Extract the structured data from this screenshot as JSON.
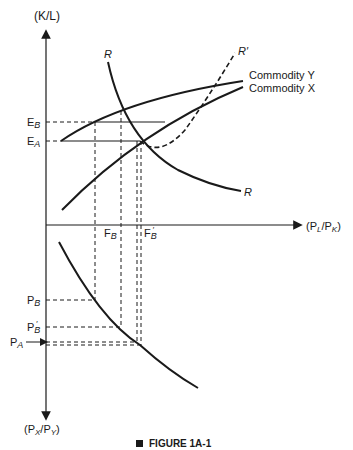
{
  "figure": {
    "caption": "FIGURE 1A-1",
    "axes": {
      "y_up_label": "(K/L)",
      "x_label": "(P_L/P_K)",
      "y_down_label": "(P_X/P_Y)"
    },
    "curves": {
      "commodity_y": "Commodity Y",
      "commodity_x": "Commodity X",
      "r_curve_top": "R",
      "r_curve_bottom": "R",
      "r_prime": "R′"
    },
    "levels": {
      "e_b": "E",
      "e_b_sub": "B",
      "e_a": "E",
      "e_a_sub": "A",
      "f_b": "F",
      "f_b_sub": "B",
      "f_b_prime": "F",
      "f_b_prime_sub": "B",
      "p_b": "P",
      "p_b_sub": "B",
      "p_b_prime": "P",
      "p_b_prime_sub": "B",
      "p_a": "P",
      "p_a_sub": "A"
    },
    "colors": {
      "ink": "#1a1a1a",
      "background": "#ffffff"
    }
  }
}
